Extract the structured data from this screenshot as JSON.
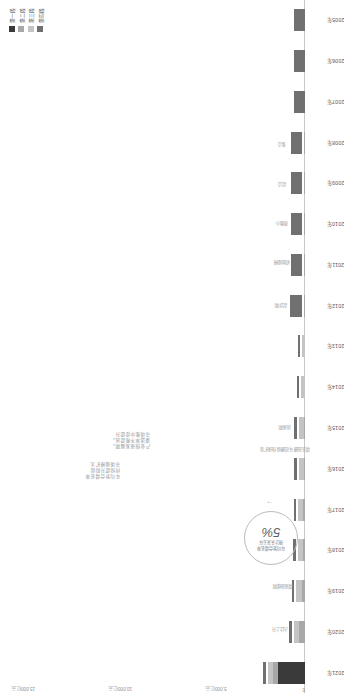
{
  "chart_data": {
    "type": "bar",
    "orientation": "horizontal-stacked",
    "title": "",
    "xlabel": "",
    "ylabel": "",
    "categories": [
      "2021年",
      "2020年",
      "2019年",
      "2018年",
      "2017年",
      "2016年",
      "2015年",
      "2014年",
      "2013年",
      "2012年",
      "2011年",
      "2010年",
      "2009年",
      "2008年",
      "2007年",
      "2006年",
      "2005年"
    ],
    "series": [
      {
        "name": "第一段",
        "color": "#3a3a3a",
        "values": [
          1400,
          0,
          0,
          0,
          0,
          0,
          0,
          0,
          0,
          0,
          0,
          0,
          0,
          0,
          0,
          0,
          0
        ]
      },
      {
        "name": "第二段",
        "color": "#a8a8a8",
        "values": [
          260,
          300,
          170,
          85,
          80,
          75,
          75,
          0,
          0,
          55,
          50,
          45,
          40,
          35,
          0,
          0,
          0
        ]
      },
      {
        "name": "第三段",
        "color": "#c4c4c4",
        "values": [
          270,
          290,
          300,
          295,
          290,
          250,
          250,
          200,
          160,
          0,
          0,
          0,
          0,
          0,
          0,
          0,
          0
        ]
      },
      {
        "name": "第四段",
        "color": "#707070",
        "values": [
          115,
          120,
          120,
          120,
          120,
          115,
          115,
          115,
          110,
          600,
          590,
          585,
          580,
          575,
          560,
          555,
          550
        ]
      }
    ],
    "value_axis_ticks": [
      "0",
      "5,000亿元",
      "10,000亿元",
      "15,000亿元"
    ],
    "grid": false,
    "legend_position": "top-left",
    "value_labels": [
      {
        "category": "2020年",
        "text": "占比上升"
      },
      {
        "category": "2019年",
        "text": "增速放缓期"
      },
      {
        "category": "2016年",
        "text": "增长高峰\n年度峰值\n快速扩张"
      },
      {
        "category": "2015年",
        "text": "高速期"
      },
      {
        "category": "2012年",
        "text": "起步期"
      },
      {
        "category": "2011年",
        "text": "初始规模"
      },
      {
        "category": "2010年",
        "text": "基数小"
      },
      {
        "category": "2009年",
        "text": "起点"
      },
      {
        "category": "2008年",
        "text": "落点"
      }
    ],
    "annotations": [
      {
        "id": "anno-growth",
        "text": "年均复合增长率\n持续提升阶段\n市场规模扩大"
      },
      {
        "id": "anno-phase",
        "text": "产业快速发展期，\n渗透率不断提高，\n市场集中度提升"
      }
    ],
    "callout": {
      "top_text": "年均复合增长率\n预计未来五年",
      "value": "5%"
    }
  },
  "legend": {
    "items": [
      {
        "label": "第一段",
        "color": "#3a3a3a"
      },
      {
        "label": "第二段",
        "color": "#a8a8a8"
      },
      {
        "label": "第三段",
        "color": "#c4c4c4"
      },
      {
        "label": "第四段",
        "color": "#707070"
      }
    ]
  }
}
